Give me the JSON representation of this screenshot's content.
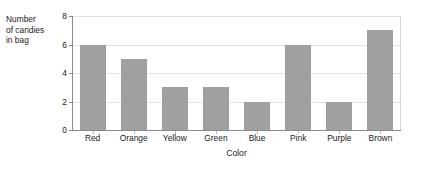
{
  "figure": {
    "cropped_title_remnant": "",
    "y_axis_caption_lines": [
      "Number",
      "of candies",
      "in bag"
    ],
    "x_axis_title": "Color"
  },
  "chart_data": {
    "type": "bar",
    "title": "",
    "xlabel": "Color",
    "ylabel": "Number of candies in bag",
    "categories": [
      "Red",
      "Orange",
      "Yellow",
      "Green",
      "Blue",
      "Pink",
      "Purple",
      "Brown"
    ],
    "values": [
      6,
      5,
      3,
      3,
      2,
      6,
      2,
      7
    ],
    "ylim": [
      0,
      8
    ],
    "yticks": [
      0,
      2,
      4,
      6,
      8
    ],
    "ytick_labels": [
      "0",
      "2",
      "4",
      "6",
      "8"
    ],
    "grid": "horizontal",
    "legend": "none",
    "bar_color": "#a0a0a0",
    "gridline_color": "#e3e3e3",
    "axis_color": "#8a8a8a"
  }
}
